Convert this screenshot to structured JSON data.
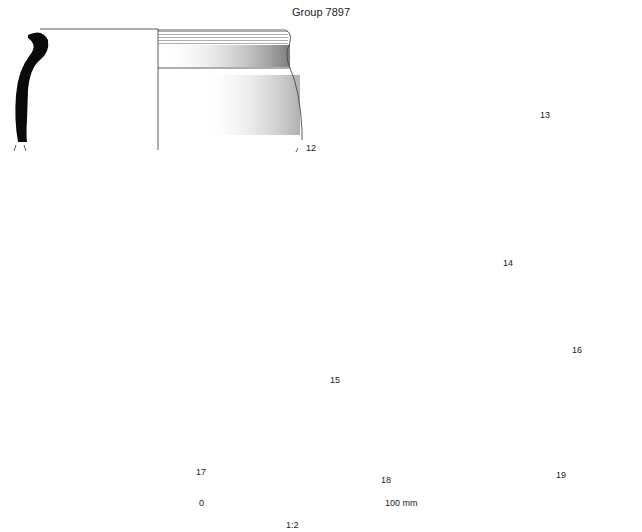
{
  "title": "Group 7897",
  "figures": [
    {
      "id": "12",
      "label": "12",
      "form": "jar with everted rim"
    },
    {
      "id": "13",
      "label": "13",
      "form": "shallow dish/bowl"
    },
    {
      "id": "14",
      "label": "14",
      "form": "jar with beaded rim and grooves"
    },
    {
      "id": "15",
      "label": "15",
      "form": "jar with beaded rim"
    },
    {
      "id": "16",
      "label": "16",
      "form": "base fragment"
    },
    {
      "id": "17",
      "label": "17",
      "form": "rim fragment"
    },
    {
      "id": "18",
      "label": "18",
      "form": "decorated sherd with incised lattice"
    },
    {
      "id": "19",
      "label": "19",
      "form": "grooved rim fragment"
    }
  ],
  "scale": {
    "start_label": "0",
    "end_label": "100 mm",
    "ratio": "1:2"
  },
  "colors": {
    "section_fill": "#0a0a0a",
    "line": "#333333",
    "shade": "#777777"
  }
}
